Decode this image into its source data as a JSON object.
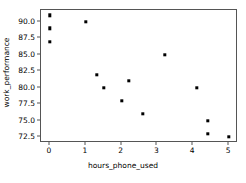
{
  "chart_data": {
    "type": "scatter",
    "title": "",
    "xlabel": "hours_phone_used",
    "ylabel": "work_performance",
    "xlim": [
      -0.25,
      5.25
    ],
    "ylim": [
      71.6,
      91.8
    ],
    "grid": false,
    "legend": null,
    "marker": {
      "shape": "square",
      "color": "#000000",
      "size": 3.4
    },
    "xticks": [
      "0",
      "1",
      "2",
      "3",
      "4",
      "5"
    ],
    "xtick_values": [
      0,
      1,
      2,
      3,
      4,
      5
    ],
    "yticks": [
      "90.0",
      "87.5",
      "85.0",
      "82.5",
      "80.0",
      "77.5",
      "75.0",
      "72.5"
    ],
    "ytick_values": [
      90.0,
      87.5,
      85.0,
      82.5,
      80.0,
      77.5,
      75.0,
      72.5
    ],
    "x": [
      0,
      0,
      0,
      1,
      1.3,
      1.5,
      2,
      2.2,
      2.6,
      3.2,
      4.1,
      4.4,
      4.4,
      5
    ],
    "y": [
      91,
      89,
      87,
      90,
      82,
      80,
      78,
      81,
      76,
      85,
      80,
      75,
      73,
      72.5
    ],
    "points": [
      {
        "x": 0,
        "y": 91
      },
      {
        "x": 0,
        "y": 89
      },
      {
        "x": 0,
        "y": 87
      },
      {
        "x": 1,
        "y": 90
      },
      {
        "x": 1.3,
        "y": 82
      },
      {
        "x": 1.5,
        "y": 80
      },
      {
        "x": 2,
        "y": 78
      },
      {
        "x": 2.2,
        "y": 81
      },
      {
        "x": 2.6,
        "y": 76
      },
      {
        "x": 3.2,
        "y": 85
      },
      {
        "x": 4.1,
        "y": 80
      },
      {
        "x": 4.4,
        "y": 75
      },
      {
        "x": 4.4,
        "y": 73
      },
      {
        "x": 5,
        "y": 72.5
      }
    ]
  },
  "figure": {
    "background_color": "#ffffff",
    "axes_edge_color": "#555555",
    "text_color": "#000000"
  }
}
